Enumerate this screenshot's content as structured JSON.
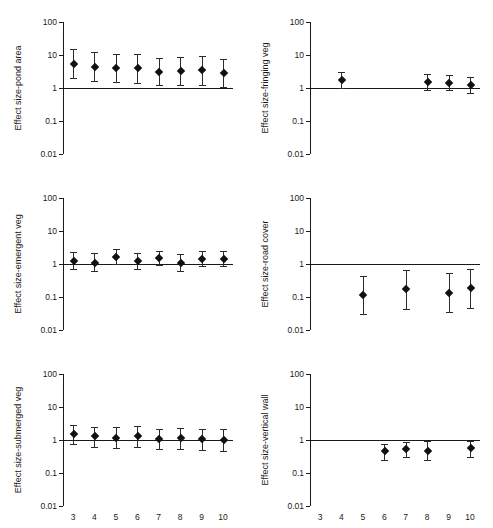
{
  "figure": {
    "x_axis_title": "Model",
    "y_tick_labels": [
      "100",
      "10",
      "1",
      "0.1",
      "0.01"
    ],
    "x_tick_labels": [
      "3",
      "4",
      "5",
      "6",
      "7",
      "8",
      "9",
      "10"
    ],
    "reference_value": 1,
    "marker_color": "#111111",
    "line_color": "#1a1a1a"
  },
  "chart_data": [
    {
      "type": "scatter",
      "panel": "top-left",
      "title": "",
      "xlabel": "Model",
      "ylabel": "Effect size-pond area",
      "yscale": "log",
      "ylim": [
        0.01,
        100
      ],
      "ytick_values": [
        100,
        10,
        1,
        0.1,
        0.01
      ],
      "reference_line": 1,
      "x": [
        3,
        4,
        5,
        6,
        7,
        8,
        9,
        10
      ],
      "values": [
        5.4,
        4.3,
        4.0,
        3.9,
        3.1,
        3.3,
        3.4,
        2.8
      ],
      "ci_low": [
        2.0,
        1.6,
        1.5,
        1.4,
        1.2,
        1.2,
        1.2,
        1.1
      ],
      "ci_high": [
        15.0,
        12.0,
        11.0,
        10.5,
        8.2,
        9.0,
        9.5,
        7.5
      ],
      "grid": false,
      "legend": "none"
    },
    {
      "type": "scatter",
      "panel": "top-right",
      "title": "",
      "xlabel": "Model",
      "ylabel": "Effect size-fringing veg",
      "yscale": "log",
      "ylim": [
        0.01,
        100
      ],
      "ytick_values": [
        100,
        10,
        1,
        0.1,
        0.01
      ],
      "reference_line": 1,
      "x": [
        4,
        8,
        9,
        10
      ],
      "values": [
        1.75,
        1.5,
        1.4,
        1.25
      ],
      "ci_low": [
        1.0,
        0.85,
        0.85,
        0.7
      ],
      "ci_high": [
        3.0,
        2.6,
        2.5,
        2.2
      ],
      "grid": false,
      "legend": "none"
    },
    {
      "type": "scatter",
      "panel": "middle-left",
      "title": "",
      "xlabel": "Model",
      "ylabel": "Effect size-emergent veg",
      "yscale": "log",
      "ylim": [
        0.01,
        100
      ],
      "ytick_values": [
        100,
        10,
        1,
        0.1,
        0.01
      ],
      "reference_line": 1,
      "x": [
        3,
        4,
        5,
        6,
        7,
        8,
        9,
        10
      ],
      "values": [
        1.25,
        1.1,
        1.65,
        1.2,
        1.5,
        1.05,
        1.45,
        1.4
      ],
      "ci_low": [
        0.72,
        0.62,
        1.0,
        0.72,
        0.92,
        0.62,
        0.9,
        0.85
      ],
      "ci_high": [
        2.3,
        2.1,
        2.8,
        2.2,
        2.5,
        1.95,
        2.5,
        2.4
      ],
      "grid": false,
      "legend": "none"
    },
    {
      "type": "scatter",
      "panel": "middle-right",
      "title": "",
      "xlabel": "Model",
      "ylabel": "Effect size-road cover",
      "yscale": "log",
      "ylim": [
        0.01,
        100
      ],
      "ytick_values": [
        100,
        10,
        1,
        0.1,
        0.01
      ],
      "reference_line": 1,
      "x": [
        5,
        7,
        9,
        10
      ],
      "values": [
        0.115,
        0.17,
        0.135,
        0.185
      ],
      "ci_low": [
        0.031,
        0.042,
        0.034,
        0.047
      ],
      "ci_high": [
        0.44,
        0.64,
        0.53,
        0.72
      ],
      "grid": false,
      "legend": "none"
    },
    {
      "type": "scatter",
      "panel": "bottom-left",
      "title": "",
      "xlabel": "Model",
      "ylabel": "Effect size-submerged veg",
      "yscale": "log",
      "ylim": [
        0.01,
        100
      ],
      "ytick_values": [
        100,
        10,
        1,
        0.1,
        0.01
      ],
      "reference_line": 1,
      "x": [
        3,
        4,
        5,
        6,
        7,
        8,
        9,
        10
      ],
      "values": [
        1.5,
        1.28,
        1.18,
        1.3,
        1.08,
        1.15,
        1.08,
        1.02
      ],
      "ci_low": [
        0.78,
        0.62,
        0.58,
        0.63,
        0.52,
        0.55,
        0.5,
        0.48
      ],
      "ci_high": [
        2.9,
        2.5,
        2.4,
        2.6,
        2.2,
        2.3,
        2.2,
        2.1
      ],
      "grid": false,
      "legend": "none"
    },
    {
      "type": "scatter",
      "panel": "bottom-right",
      "title": "",
      "xlabel": "Model",
      "ylabel": "Effect size-vertical wall",
      "yscale": "log",
      "ylim": [
        0.01,
        100
      ],
      "ytick_values": [
        100,
        10,
        1,
        0.1,
        0.01
      ],
      "reference_line": 1,
      "x": [
        6,
        7,
        8,
        10
      ],
      "values": [
        0.45,
        0.53,
        0.48,
        0.57
      ],
      "ci_low": [
        0.24,
        0.3,
        0.24,
        0.3
      ],
      "ci_high": [
        0.78,
        0.88,
        0.95,
        0.95
      ],
      "grid": false,
      "legend": "none"
    }
  ]
}
